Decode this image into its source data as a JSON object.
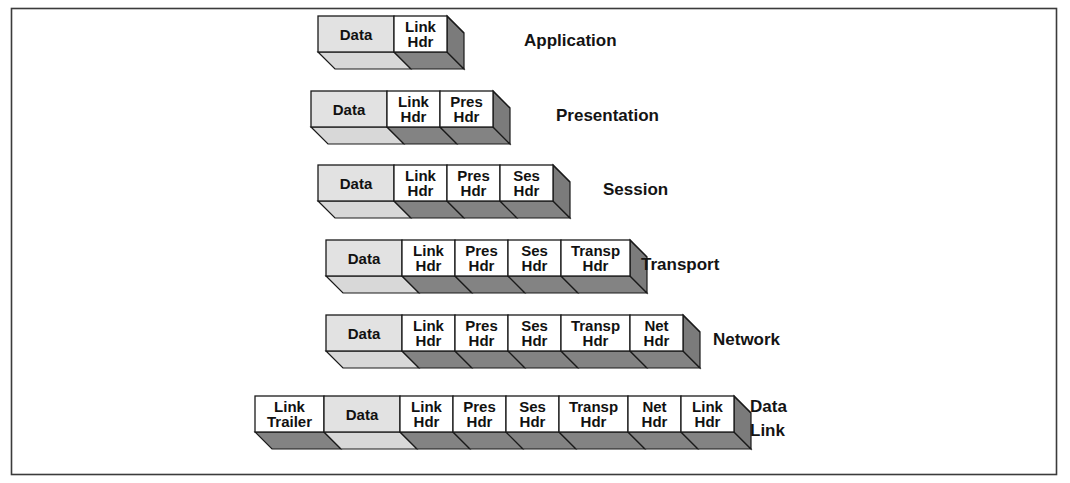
{
  "figure": {
    "kind": "layered-encapsulation-diagram",
    "frame": {
      "border_color": "#3b3b3b",
      "background": "#ffffff"
    }
  },
  "palette": {
    "data_face": "#e2e2e2",
    "data_bottom": "#d8d8d8",
    "header_face": "#ffffff",
    "header_bottom": "#838383",
    "header_side": "#7b7b7b",
    "outline": "#1a1a1a",
    "text": "#111111"
  },
  "geometry": {
    "depth_x": 17,
    "depth_y": 17,
    "row_height": 36,
    "row_pitch": 74.5,
    "unit_width": 58
  },
  "rows": [
    {
      "layer_label": "Application",
      "label_lines": [
        "Application"
      ],
      "label_x": 524,
      "label_y": 46,
      "origin_x": 318,
      "origin_y": 16,
      "blocks": [
        {
          "lines": [
            "Data"
          ],
          "width": 76,
          "kind": "data"
        },
        {
          "lines": [
            "Link",
            "Hdr"
          ],
          "width": 53,
          "kind": "header"
        }
      ]
    },
    {
      "layer_label": "Presentation",
      "label_lines": [
        "Presentation"
      ],
      "label_x": 556,
      "label_y": 121,
      "origin_x": 311,
      "origin_y": 91,
      "blocks": [
        {
          "lines": [
            "Data"
          ],
          "width": 76,
          "kind": "data"
        },
        {
          "lines": [
            "Link",
            "Hdr"
          ],
          "width": 53,
          "kind": "header"
        },
        {
          "lines": [
            "Pres",
            "Hdr"
          ],
          "width": 53,
          "kind": "header"
        }
      ]
    },
    {
      "layer_label": "Session",
      "label_lines": [
        "Session"
      ],
      "label_x": 603,
      "label_y": 195,
      "origin_x": 318,
      "origin_y": 165,
      "blocks": [
        {
          "lines": [
            "Data"
          ],
          "width": 76,
          "kind": "data"
        },
        {
          "lines": [
            "Link",
            "Hdr"
          ],
          "width": 53,
          "kind": "header"
        },
        {
          "lines": [
            "Pres",
            "Hdr"
          ],
          "width": 53,
          "kind": "header"
        },
        {
          "lines": [
            "Ses",
            "Hdr"
          ],
          "width": 53,
          "kind": "header"
        }
      ]
    },
    {
      "layer_label": "Transport",
      "label_lines": [
        "Transport"
      ],
      "label_x": 641,
      "label_y": 270,
      "origin_x": 326,
      "origin_y": 240,
      "blocks": [
        {
          "lines": [
            "Data"
          ],
          "width": 76,
          "kind": "data"
        },
        {
          "lines": [
            "Link",
            "Hdr"
          ],
          "width": 53,
          "kind": "header"
        },
        {
          "lines": [
            "Pres",
            "Hdr"
          ],
          "width": 53,
          "kind": "header"
        },
        {
          "lines": [
            "Ses",
            "Hdr"
          ],
          "width": 53,
          "kind": "header"
        },
        {
          "lines": [
            "Transp",
            "Hdr"
          ],
          "width": 69,
          "kind": "header"
        }
      ]
    },
    {
      "layer_label": "Network",
      "label_lines": [
        "Network"
      ],
      "label_x": 713,
      "label_y": 345,
      "origin_x": 326,
      "origin_y": 315,
      "blocks": [
        {
          "lines": [
            "Data"
          ],
          "width": 76,
          "kind": "data"
        },
        {
          "lines": [
            "Link",
            "Hdr"
          ],
          "width": 53,
          "kind": "header"
        },
        {
          "lines": [
            "Pres",
            "Hdr"
          ],
          "width": 53,
          "kind": "header"
        },
        {
          "lines": [
            "Ses",
            "Hdr"
          ],
          "width": 53,
          "kind": "header"
        },
        {
          "lines": [
            "Transp",
            "Hdr"
          ],
          "width": 69,
          "kind": "header"
        },
        {
          "lines": [
            "Net",
            "Hdr"
          ],
          "width": 53,
          "kind": "header"
        }
      ]
    },
    {
      "layer_label": "Data Link",
      "label_lines": [
        "Data",
        "Link"
      ],
      "label_x": 750,
      "label_y": 412,
      "origin_x": 255,
      "origin_y": 396,
      "blocks": [
        {
          "lines": [
            "Link",
            "Trailer"
          ],
          "width": 69,
          "kind": "header"
        },
        {
          "lines": [
            "Data"
          ],
          "width": 76,
          "kind": "data"
        },
        {
          "lines": [
            "Link",
            "Hdr"
          ],
          "width": 53,
          "kind": "header"
        },
        {
          "lines": [
            "Pres",
            "Hdr"
          ],
          "width": 53,
          "kind": "header"
        },
        {
          "lines": [
            "Ses",
            "Hdr"
          ],
          "width": 53,
          "kind": "header"
        },
        {
          "lines": [
            "Transp",
            "Hdr"
          ],
          "width": 69,
          "kind": "header"
        },
        {
          "lines": [
            "Net",
            "Hdr"
          ],
          "width": 53,
          "kind": "header"
        },
        {
          "lines": [
            "Link",
            "Hdr"
          ],
          "width": 53,
          "kind": "header"
        }
      ]
    }
  ]
}
